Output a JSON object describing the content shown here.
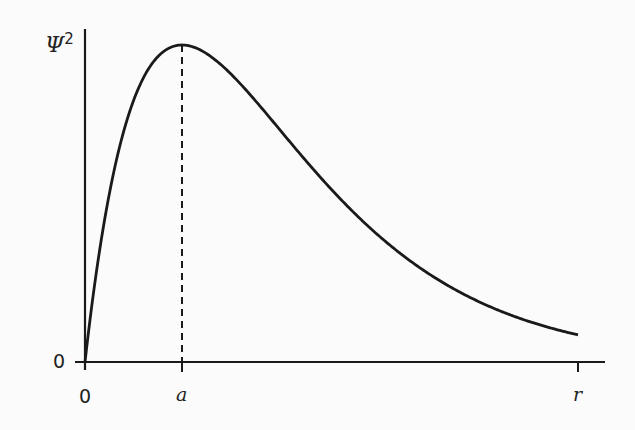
{
  "chart_data": {
    "type": "line",
    "title": "",
    "xlabel": "r",
    "ylabel": "Ψ²",
    "x_ticks": [
      "0",
      "a",
      "r"
    ],
    "y_ticks": [
      "0"
    ],
    "series": [
      {
        "name": "Ψ² (r/a)·e^(1−r/a)",
        "x": [
          0,
          0.25,
          0.5,
          0.75,
          1,
          1.5,
          2,
          2.5,
          3,
          3.5,
          4,
          4.5,
          5.08
        ],
        "values": [
          0,
          0.53,
          0.82,
          0.96,
          1.0,
          0.91,
          0.74,
          0.56,
          0.41,
          0.29,
          0.2,
          0.14,
          0.086
        ]
      }
    ],
    "annotations": [
      {
        "type": "dashed-vline",
        "x": "a",
        "label": "peak at r = a"
      }
    ],
    "grid": false,
    "legend": "none"
  },
  "labels": {
    "ylabel_main": "Ψ",
    "ylabel_sup": "2",
    "y_zero": "0",
    "x_zero": "0",
    "x_peak": "a",
    "x_end": "r"
  },
  "colors": {
    "line": "#1a1a1a",
    "background": "#fbfbfb"
  }
}
